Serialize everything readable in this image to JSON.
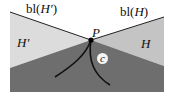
{
  "diagram": {
    "colors": {
      "background": "#ffffff",
      "region_H_prime": "#dcdcdc",
      "region_H": "#c8c8c8",
      "region_lower": "#6e6e6e",
      "boundary_line": "#222222",
      "curve": "#111111"
    },
    "labels": {
      "boundary_left_prefix": "bl(",
      "boundary_left_var": "H'",
      "boundary_left_suffix": ")",
      "boundary_right_prefix": "bl(",
      "boundary_right_var": "H",
      "boundary_right_suffix": ")",
      "region_left": "H'",
      "region_right": "H",
      "point": "P",
      "curve": "c"
    },
    "point_P": {
      "x": 91,
      "y": 40
    }
  }
}
